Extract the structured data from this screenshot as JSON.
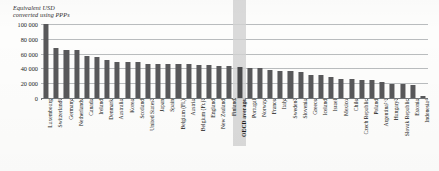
{
  "chart_data": {
    "type": "bar",
    "title": "",
    "axis_title": "Equivalent USD\nconverted using PPPs",
    "xlabel": "",
    "ylabel": "Equivalent USD converted using PPPs",
    "ylim": [
      0,
      100000
    ],
    "grid": true,
    "legend": "none",
    "tick_labels": [
      "100 000",
      "80 000",
      "60 000",
      "40 000",
      "20 000",
      "0"
    ],
    "tick_values": [
      100000,
      80000,
      60000,
      40000,
      20000,
      0
    ],
    "highlight_category": "OECD average",
    "categories": [
      "Luxembourg",
      "Switzerland¹",
      "Germany",
      "Netherlands",
      "Canada",
      "Ireland",
      "Denmark",
      "Australia",
      "Korea",
      "Scotland",
      "United States²",
      "Japan",
      "Spain",
      "Belgium (Fl.)",
      "Austria",
      "Belgium (Fr.)³",
      "England",
      "New Zealand",
      "Finland",
      "OECD average",
      "Portugal",
      "Norway",
      "France",
      "Italy",
      "Sweden²",
      "Slovenia",
      "Greece",
      "Iceland",
      "Israel",
      "Mexico",
      "Chile",
      "Czech Republic",
      "Poland",
      "Argentina²·³",
      "Hungary²",
      "Slovak Republic",
      "Estonia",
      "Indonesia⁴"
    ],
    "values": [
      100000,
      68000,
      65000,
      65000,
      57000,
      56000,
      51000,
      49000,
      49000,
      49000,
      46000,
      46000,
      46000,
      46000,
      45500,
      44500,
      44000,
      43500,
      43000,
      42000,
      41000,
      40500,
      38000,
      36500,
      36000,
      34500,
      31000,
      30500,
      29000,
      26000,
      25500,
      25000,
      24500,
      22000,
      19000,
      18500,
      17000,
      3000
    ]
  },
  "colors": {
    "bar": "#58585a",
    "highlight_band": "#d2d2d2",
    "gridline": "#b9bcbe",
    "axis": "#6f7376",
    "text": "#161616",
    "background": "#fdfdfc"
  }
}
